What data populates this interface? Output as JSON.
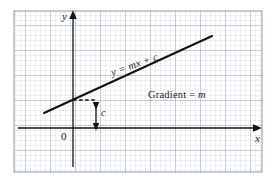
{
  "figure": {
    "kind": "cartesian-graph",
    "background": "#ffffff"
  },
  "grid": {
    "minor_color": "#c9d2de",
    "major_color": "#9aa7b8",
    "border_color": "#8d99a8",
    "minor_spacing_px": 5,
    "major_every": 5,
    "left": 14,
    "top": 11,
    "right": 262,
    "bottom": 172
  },
  "axes": {
    "color": "#111111",
    "y_label": "y",
    "x_label": "x",
    "origin_label": "0",
    "x_axis_y": 128,
    "y_axis_x": 73
  },
  "line": {
    "color": "#111111",
    "width_px": 2.1,
    "x1": 44,
    "y1": 113,
    "x2": 212,
    "y2": 36,
    "equation": "y = mx + c"
  },
  "intercept": {
    "label": "c",
    "dashed_color": "#111111",
    "arrow_x": 96,
    "arrow_top": 99,
    "arrow_bottom": 128,
    "dash_x1": 73,
    "dash_x2": 96,
    "dash_y": 100
  },
  "annotations": {
    "gradient_text": "Gradient = ",
    "gradient_symbol": "m"
  }
}
